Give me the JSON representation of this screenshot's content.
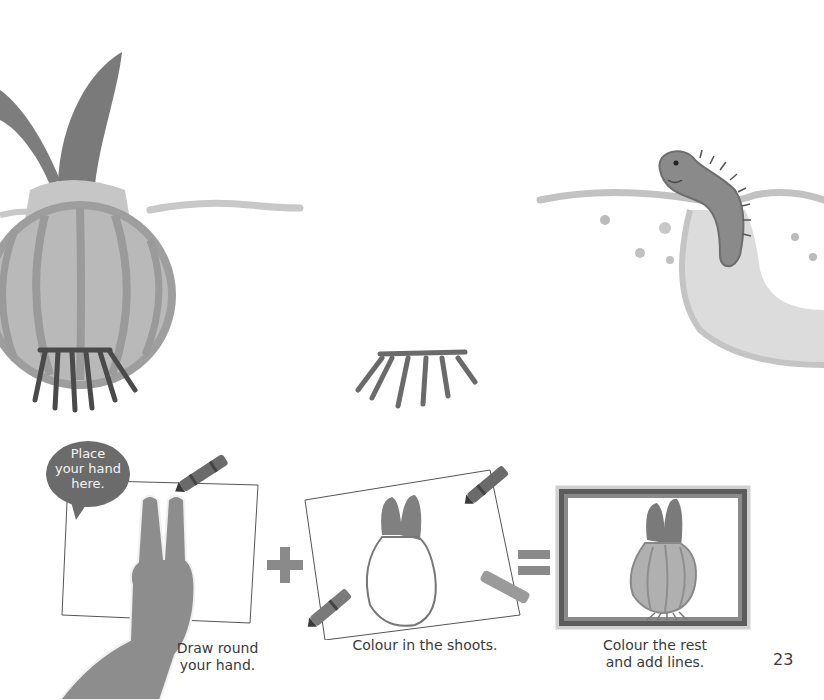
{
  "page": {
    "number": "23",
    "background": "#ffffff"
  },
  "illustrations": {
    "sprouting_onion": "sprouting-onion-with-roots",
    "roots_cutout": "onion-roots",
    "worm_in_soil": "worm-emerging-from-soil"
  },
  "steps": [
    {
      "id": "step-1",
      "speech_bubble": {
        "line1": "Place",
        "line2": "your hand",
        "line3": "here."
      },
      "caption_line1": "Draw round",
      "caption_line2": "your hand."
    },
    {
      "id": "step-2",
      "caption": "Colour in the shoots."
    },
    {
      "id": "step-3",
      "caption_line1": "Colour the rest",
      "caption_line2": "and add lines."
    }
  ],
  "operators": {
    "plus": "+",
    "equals": "="
  },
  "colors": {
    "crayon_dark": "#5a5a5a",
    "bubble": "#6b6b6b",
    "onion_fill": "#b8b8b8",
    "shoot": "#7a7a7a",
    "frame": "#5c5c5c",
    "operator": "#8a8a8a"
  }
}
